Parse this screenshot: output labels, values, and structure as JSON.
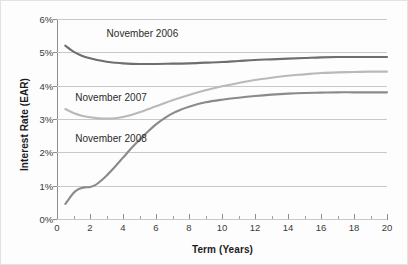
{
  "chart_data": {
    "type": "line",
    "title": "",
    "xlabel": "Term (Years)",
    "ylabel": "Interest Rate (EAR)",
    "xlim": [
      0,
      20
    ],
    "ylim": [
      0,
      6
    ],
    "grid": true,
    "legend_position": "inline-annotations",
    "xticks": [
      0,
      2,
      4,
      6,
      8,
      10,
      12,
      14,
      16,
      18,
      20
    ],
    "xtick_labels": [
      "0",
      "2",
      "4",
      "6",
      "8",
      "10",
      "12",
      "14",
      "16",
      "18",
      "20"
    ],
    "yticks": [
      0,
      1,
      2,
      3,
      4,
      5,
      6
    ],
    "ytick_labels": [
      "0%",
      "1%",
      "2%",
      "3%",
      "4%",
      "5%",
      "6%"
    ],
    "series": [
      {
        "name": "November 2006",
        "color": "#6e6e6e",
        "label_x": 3.0,
        "label_y": 5.55,
        "x": [
          0.5,
          1,
          1.5,
          2,
          2.5,
          3,
          3.5,
          4,
          5,
          6,
          7,
          8,
          9,
          10,
          11,
          12,
          13,
          14,
          15,
          16,
          17,
          18,
          19,
          20
        ],
        "y": [
          5.2,
          5.02,
          4.9,
          4.82,
          4.76,
          4.72,
          4.69,
          4.67,
          4.65,
          4.65,
          4.66,
          4.67,
          4.69,
          4.71,
          4.74,
          4.77,
          4.79,
          4.81,
          4.83,
          4.85,
          4.86,
          4.86,
          4.86,
          4.86
        ]
      },
      {
        "name": "November 2007",
        "color": "#b9b9b9",
        "label_x": 1.1,
        "label_y": 3.62,
        "x": [
          0.5,
          1,
          1.5,
          2,
          2.5,
          3,
          3.5,
          4,
          4.5,
          5,
          6,
          7,
          8,
          9,
          10,
          11,
          12,
          13,
          14,
          15,
          16,
          17,
          18,
          19,
          20
        ],
        "y": [
          3.3,
          3.18,
          3.1,
          3.05,
          3.02,
          3.01,
          3.02,
          3.06,
          3.12,
          3.2,
          3.38,
          3.56,
          3.72,
          3.86,
          3.98,
          4.08,
          4.17,
          4.24,
          4.3,
          4.34,
          4.38,
          4.4,
          4.41,
          4.42,
          4.42
        ]
      },
      {
        "name": "November 2008",
        "color": "#8a8a8a",
        "label_x": 1.1,
        "label_y": 2.4,
        "x": [
          0.5,
          0.75,
          1,
          1.25,
          1.5,
          1.75,
          2,
          2.25,
          2.5,
          3,
          3.5,
          4,
          4.5,
          5,
          5.5,
          6,
          6.5,
          7,
          7.5,
          8,
          9,
          10,
          11,
          12,
          13,
          14,
          15,
          16,
          17,
          18,
          19,
          20
        ],
        "y": [
          0.45,
          0.62,
          0.78,
          0.88,
          0.93,
          0.95,
          0.96,
          1.0,
          1.08,
          1.3,
          1.56,
          1.84,
          2.12,
          2.38,
          2.62,
          2.84,
          3.02,
          3.17,
          3.28,
          3.37,
          3.5,
          3.58,
          3.64,
          3.69,
          3.73,
          3.76,
          3.78,
          3.79,
          3.8,
          3.8,
          3.8,
          3.8
        ]
      }
    ]
  }
}
